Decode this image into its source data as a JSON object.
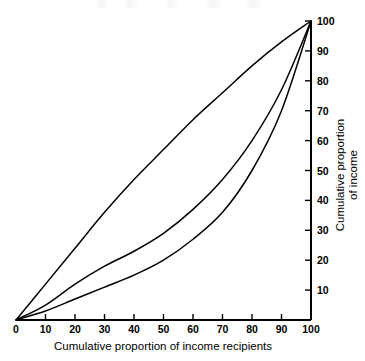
{
  "figure": {
    "name": "lorenz-curve-figure",
    "background": "#ffffff",
    "ink_color": "#000000"
  },
  "axes": {
    "x_title": "Cumulative proportion of income recipients",
    "y_title_line1": "Cumulative proportion",
    "y_title_line2": "of income",
    "x_ticks": [
      "0",
      "10",
      "20",
      "30",
      "40",
      "50",
      "60",
      "70",
      "80",
      "90",
      "100"
    ],
    "y_ticks": [
      "10",
      "20",
      "30",
      "40",
      "50",
      "60",
      "70",
      "80",
      "90",
      "100"
    ]
  },
  "chart_data": {
    "type": "line",
    "title": "",
    "subtitle": "",
    "xlabel": "Cumulative proportion of income recipients",
    "ylabel": "Cumulative proportion of income",
    "xlim": [
      0,
      100
    ],
    "ylim": [
      0,
      100
    ],
    "xticks": [
      0,
      10,
      20,
      30,
      40,
      50,
      60,
      70,
      80,
      90,
      100
    ],
    "yticks": [
      0,
      10,
      20,
      30,
      40,
      50,
      60,
      70,
      80,
      90,
      100
    ],
    "grid": false,
    "legend": "none",
    "y_axis_position": "right",
    "annotations": [],
    "x": [
      0,
      10,
      20,
      30,
      40,
      50,
      60,
      70,
      80,
      90,
      100
    ],
    "series": [
      {
        "name": "Low inequality Lorenz curve",
        "values": [
          0,
          12,
          24,
          36,
          47,
          57,
          67,
          76,
          85,
          93,
          100
        ]
      },
      {
        "name": "Moderate inequality Lorenz curve",
        "values": [
          0,
          5,
          12,
          18,
          23,
          29,
          37,
          47,
          60,
          77,
          100
        ]
      },
      {
        "name": "High inequality Lorenz curve",
        "values": [
          0,
          3,
          7,
          11,
          15,
          20,
          27,
          36,
          50,
          70,
          100
        ]
      }
    ]
  }
}
